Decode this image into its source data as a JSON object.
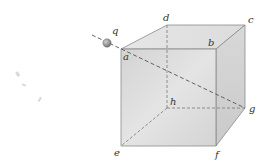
{
  "diagram": {
    "charge": {
      "label": "q",
      "x": 107,
      "y": 43
    },
    "vertices": {
      "a": {
        "label": "a",
        "x": 121,
        "y": 49
      },
      "b": {
        "label": "b",
        "x": 216,
        "y": 49
      },
      "c": {
        "label": "c",
        "x": 245,
        "y": 25
      },
      "d": {
        "label": "d",
        "x": 167,
        "y": 25
      },
      "e": {
        "label": "e",
        "x": 121,
        "y": 146
      },
      "f": {
        "label": "f",
        "x": 216,
        "y": 146
      },
      "g": {
        "label": "g",
        "x": 245,
        "y": 108
      },
      "h": {
        "label": "h",
        "x": 167,
        "y": 108
      }
    },
    "hidden_edges": [
      "d-h",
      "h-g",
      "h-e"
    ],
    "diagonal": {
      "from": "q",
      "through": "a",
      "to": "g",
      "style": "dashed"
    },
    "colors": {
      "edge": "#8a8a8a",
      "face_front": "#d6d6d6",
      "face_top": "#e4e4e4",
      "face_side": "#cfcfcf",
      "charge": "#8f8f8f",
      "dashed": "#555555"
    }
  }
}
